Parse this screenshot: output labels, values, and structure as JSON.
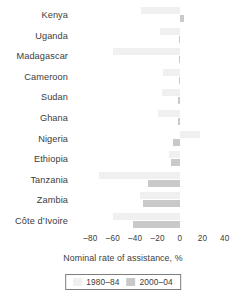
{
  "chart_data": {
    "type": "bar",
    "orientation": "horizontal",
    "title": "",
    "xlabel": "Nominal rate of assistance, %",
    "ylabel": "",
    "xlim": [
      -90,
      45
    ],
    "xticks": [
      -80,
      -60,
      -40,
      -20,
      0,
      20,
      40
    ],
    "xtick_labels": [
      "–80",
      "–60",
      "–40",
      "–20",
      "0",
      "20",
      "40"
    ],
    "grid": false,
    "legend_position": "bottom-center",
    "categories": [
      "Kenya",
      "Uganda",
      "Madagascar",
      "Cameroon",
      "Sudan",
      "Ghana",
      "Nigeria",
      "Ethiopia",
      "Tanzania",
      "Zambia",
      "Côte d’Ivoire"
    ],
    "series": [
      {
        "name": "1980–84",
        "color": "#f0f0f0",
        "values": [
          -35,
          -18,
          -60,
          -15,
          -16,
          -20,
          18,
          -10,
          -72,
          -36,
          -60
        ]
      },
      {
        "name": "2000–04",
        "color": "#c9c9c9",
        "values": [
          4,
          -1,
          -1,
          -1,
          -2,
          -2,
          -6,
          -8,
          -29,
          -33,
          -42
        ]
      }
    ]
  },
  "legend": {
    "entries": [
      {
        "label": "1980–84",
        "swatch": "early"
      },
      {
        "label": "2000–04",
        "swatch": "late"
      }
    ]
  }
}
